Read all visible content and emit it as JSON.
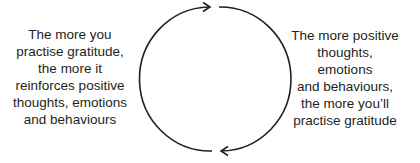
{
  "diagram": {
    "type": "cycle",
    "left_text": {
      "lines": [
        "The more you",
        "practise gratitude,",
        "the more it",
        "reinforces positive",
        "thoughts, emotions",
        "and behaviours"
      ]
    },
    "right_text": {
      "lines": [
        "The more positive",
        "thoughts,",
        "emotions",
        "and behaviours,",
        "the more you’ll",
        "practise gratitude"
      ]
    },
    "arrows": [
      {
        "name": "top-arrow",
        "direction": "right",
        "from": "left-arc",
        "to": "right-arc"
      },
      {
        "name": "bottom-arrow",
        "direction": "left",
        "from": "right-arc",
        "to": "left-arc"
      }
    ],
    "colors": {
      "text": "#231f20",
      "stroke": "#231f20",
      "background": "#ffffff"
    }
  }
}
